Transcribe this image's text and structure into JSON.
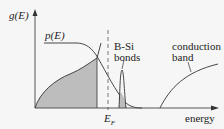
{
  "diagram": {
    "y_axis_label": "g(E)",
    "x_axis_label": "energy",
    "curve_p_label": "p(E)",
    "peak_label_line1": "B-Si",
    "peak_label_line2": "bonds",
    "conduction_label_line1": "conduction",
    "conduction_label_line2": "band",
    "fermi_label": "E",
    "fermi_subscript": "F",
    "colors": {
      "line": "#333333",
      "fill": "#bdbdbd",
      "background": "#f6f6f6"
    }
  }
}
